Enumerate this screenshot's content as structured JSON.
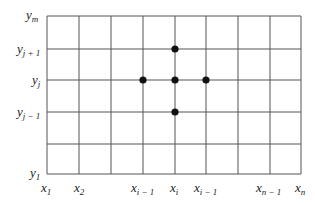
{
  "diagram": {
    "type": "finite-difference-grid",
    "grid": {
      "left": 47,
      "right": 301,
      "top": 16,
      "bottom": 174,
      "vertical_lines_x": [
        47,
        79,
        111,
        143,
        175,
        206,
        238,
        270,
        301
      ],
      "horizontal_lines_y": [
        16,
        49,
        80,
        112,
        144,
        174
      ],
      "line_color": "#555555"
    },
    "points": [
      {
        "name": "node-i-jplus1",
        "x": 175,
        "y": 49
      },
      {
        "name": "node-iminus1-j",
        "x": 143,
        "y": 80
      },
      {
        "name": "node-i-j",
        "x": 175,
        "y": 80
      },
      {
        "name": "node-iplus1-j",
        "x": 206,
        "y": 80
      },
      {
        "name": "node-i-jminus1",
        "x": 175,
        "y": 112
      }
    ],
    "point_color": "#111111",
    "y_labels": [
      {
        "base": "y",
        "sub": "m",
        "x": 26,
        "y": 8
      },
      {
        "base": "y",
        "sub": "j + 1",
        "x": 17,
        "y": 42
      },
      {
        "base": "y",
        "sub": "j",
        "x": 32,
        "y": 73
      },
      {
        "base": "y",
        "sub": "j − 1",
        "x": 17,
        "y": 105
      },
      {
        "base": "y",
        "sub": "1",
        "x": 30,
        "y": 166
      }
    ],
    "x_labels": [
      {
        "base": "x",
        "sub": "1",
        "x": 41,
        "y": 181
      },
      {
        "base": "x",
        "sub": "2",
        "x": 74,
        "y": 181
      },
      {
        "base": "x",
        "sub": "i − 1",
        "x": 131,
        "y": 181
      },
      {
        "base": "x",
        "sub": "i",
        "x": 170,
        "y": 181
      },
      {
        "base": "x",
        "sub": "i − 1",
        "x": 194,
        "y": 181
      },
      {
        "base": "x",
        "sub": "n − 1",
        "x": 256,
        "y": 181
      },
      {
        "base": "x",
        "sub": "n",
        "x": 295,
        "y": 181
      }
    ]
  }
}
